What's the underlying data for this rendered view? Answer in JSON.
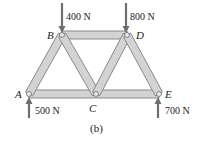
{
  "figure": {
    "caption": "(b)",
    "colors": {
      "member_fill": "#d3d3d3",
      "member_stroke": "#8a8a8a",
      "arrow": "#6e6e6e",
      "text": "#222222"
    },
    "joints": [
      {
        "id": "A",
        "label": "A",
        "x": 29,
        "y": 94
      },
      {
        "id": "B",
        "label": "B",
        "x": 62,
        "y": 35
      },
      {
        "id": "C",
        "label": "C",
        "x": 96,
        "y": 94
      },
      {
        "id": "D",
        "label": "D",
        "x": 127,
        "y": 35
      },
      {
        "id": "E",
        "label": "E",
        "x": 159,
        "y": 94
      }
    ],
    "members": [
      [
        "A",
        "B"
      ],
      [
        "B",
        "C"
      ],
      [
        "C",
        "D"
      ],
      [
        "D",
        "E"
      ],
      [
        "B",
        "D"
      ],
      [
        "A",
        "C"
      ],
      [
        "C",
        "E"
      ]
    ],
    "forces": [
      {
        "joint": "B",
        "label": "400 N",
        "direction": "down"
      },
      {
        "joint": "D",
        "label": "800 N",
        "direction": "down"
      },
      {
        "joint": "A",
        "label": "500 N",
        "direction": "up"
      },
      {
        "joint": "E",
        "label": "700 N",
        "direction": "up"
      }
    ]
  }
}
